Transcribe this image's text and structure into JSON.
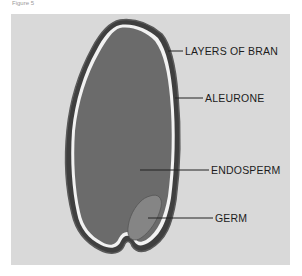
{
  "figure": {
    "caption": "Figure 5",
    "colors": {
      "panel": "#d9d9d9",
      "endosperm": "#6b6b6b",
      "germ": "#878787",
      "bran": "#4a4a4a",
      "aleurone_highlight": "#f5f5f5",
      "label_text": "#1c1c1c"
    },
    "labels": [
      {
        "id": "bran",
        "text": "LAYERS OF BRAN"
      },
      {
        "id": "aleurone",
        "text": "ALEURONE"
      },
      {
        "id": "endosperm",
        "text": "ENDOSPERM"
      },
      {
        "id": "germ",
        "text": "GERM"
      }
    ]
  }
}
